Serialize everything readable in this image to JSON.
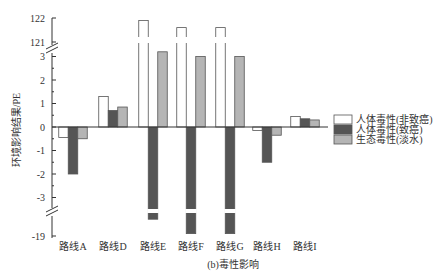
{
  "chart_data": {
    "type": "bar",
    "title": "",
    "caption": "(b)毒性影响",
    "xlabel": "",
    "ylabel": "环境影响结果/PE",
    "categories": [
      "路线A",
      "路线D",
      "路线E",
      "路线F",
      "路线G",
      "路线H",
      "路线I"
    ],
    "series": [
      {
        "name": "人体毒性(非致癌)",
        "color": "#ffffff",
        "values": [
          -0.45,
          1.3,
          121.9,
          121.6,
          121.6,
          -0.15,
          0.45
        ]
      },
      {
        "name": "人体毒性(致癌)",
        "color": "#555555",
        "values": [
          -2.0,
          0.7,
          -18.3,
          -18.9,
          -18.9,
          -1.5,
          0.35
        ]
      },
      {
        "name": "生态毒性(淡水)",
        "color": "#b5b5b5",
        "values": [
          -0.5,
          0.85,
          3.2,
          3.0,
          3.0,
          -0.35,
          0.3
        ]
      }
    ],
    "y_ticks": [
      "122",
      "121",
      "3",
      "2",
      "1",
      "0",
      "-1",
      "-2",
      "-3",
      "-19"
    ],
    "axis_breaks": [
      [
        3.3,
        120.8
      ],
      [
        -3.5,
        -18.5
      ]
    ],
    "ylim": [
      -19,
      122
    ],
    "grid": false,
    "legend_position": "right"
  }
}
